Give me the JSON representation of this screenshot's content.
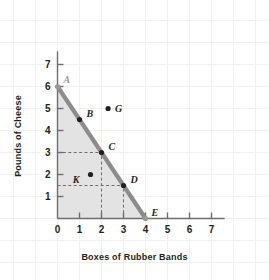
{
  "chart_data": {
    "type": "line",
    "title": "",
    "xlabel": "Boxes of Rubber Bands",
    "ylabel": "Pounds of Cheese",
    "xlim": [
      0,
      7.6
    ],
    "ylim": [
      0,
      7.6
    ],
    "xticks": [
      "0",
      "1",
      "2",
      "3",
      "4",
      "5",
      "6",
      "7"
    ],
    "yticks": [
      "0",
      "1",
      "2",
      "3",
      "4",
      "5",
      "6",
      "7"
    ],
    "grid": true,
    "legend": "none",
    "series": [
      {
        "name": "Production Possibilities Frontier",
        "type": "line",
        "color": "#8c8c8c",
        "x": [
          0,
          4
        ],
        "y": [
          6,
          0
        ]
      }
    ],
    "shaded_region": {
      "name": "feasible-region",
      "color": "#e3e3e3",
      "vertices": [
        [
          0,
          0
        ],
        [
          0,
          6
        ],
        [
          4,
          0
        ]
      ]
    },
    "points": [
      {
        "label": "A",
        "x": 0,
        "y": 6,
        "marker": "dot",
        "marker_color": "#9a9a9a",
        "label_color": "#9a9a9a",
        "label_dx": 6,
        "label_dy": -7,
        "on_frontier": true
      },
      {
        "label": "B",
        "x": 1,
        "y": 4.5,
        "marker": "dot",
        "marker_color": "#231f20",
        "label_color": "#231f20",
        "label_dx": 7,
        "label_dy": -6,
        "on_frontier": true
      },
      {
        "label": "C",
        "x": 2,
        "y": 3,
        "marker": "dot",
        "marker_color": "#231f20",
        "label_color": "#231f20",
        "label_dx": 7,
        "label_dy": -6,
        "on_frontier": true
      },
      {
        "label": "D",
        "x": 3,
        "y": 1.5,
        "marker": "dot",
        "marker_color": "#231f20",
        "label_color": "#231f20",
        "label_dx": 7,
        "label_dy": -6,
        "on_frontier": true
      },
      {
        "label": "E",
        "x": 4,
        "y": 0,
        "marker": "dot",
        "marker_color": "#9a9a9a",
        "label_color": "#231f20",
        "label_dx": 6,
        "label_dy": -6,
        "on_frontier": true
      },
      {
        "label": "G",
        "x": 2.3,
        "y": 5,
        "marker": "dot",
        "marker_color": "#231f20",
        "label_color": "#231f20",
        "label_dx": 7,
        "label_dy": 0,
        "on_frontier": false
      },
      {
        "label": "K",
        "x": 1.5,
        "y": 2,
        "marker": "dot",
        "marker_color": "#231f20",
        "label_color": "#231f20",
        "label_dx": -11,
        "label_dy": 5,
        "on_frontier": false
      }
    ],
    "guide_lines": [
      {
        "name": "guide-c-horizontal",
        "from": [
          0,
          3
        ],
        "to": [
          2,
          3
        ]
      },
      {
        "name": "guide-c-vertical",
        "from": [
          2,
          0
        ],
        "to": [
          2,
          3
        ]
      },
      {
        "name": "guide-d-horizontal",
        "from": [
          0,
          1.5
        ],
        "to": [
          3,
          1.5
        ]
      },
      {
        "name": "guide-d-vertical",
        "from": [
          3,
          0
        ],
        "to": [
          3,
          1.5
        ]
      }
    ],
    "colors": {
      "frontier": "#8c8c8c",
      "shade": "#e3e3e3",
      "axis": "#6e6e6e",
      "grid": "#f0f0f0",
      "text": "#231f20",
      "muted_text": "#9a9a9a",
      "background": "#ffffff"
    }
  }
}
